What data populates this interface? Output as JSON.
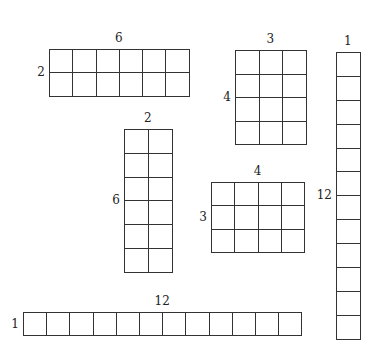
{
  "diagram": {
    "line_color": "#333333",
    "rectangles": [
      {
        "id": "r6x2",
        "cols": 6,
        "rows": 2,
        "width_label": "6",
        "height_label": "2",
        "x": 49,
        "y": 49,
        "cell": 23.3
      },
      {
        "id": "r3x4",
        "cols": 3,
        "rows": 4,
        "width_label": "3",
        "height_label": "4",
        "x": 235,
        "y": 50,
        "cell": 23.5
      },
      {
        "id": "r2x6",
        "cols": 2,
        "rows": 6,
        "width_label": "2",
        "height_label": "6",
        "x": 124,
        "y": 129,
        "cell": 23.8
      },
      {
        "id": "r4x3",
        "cols": 4,
        "rows": 3,
        "width_label": "4",
        "height_label": "3",
        "x": 211,
        "y": 182,
        "cell": 23.3
      },
      {
        "id": "r12x1",
        "cols": 12,
        "rows": 1,
        "width_label": "12",
        "height_label": "1",
        "x": 23,
        "y": 312,
        "cell": 23.2
      },
      {
        "id": "r1x12",
        "cols": 1,
        "rows": 12,
        "width_label": "1",
        "height_label": "12",
        "x": 336,
        "y": 52,
        "cell": 23.9
      }
    ]
  }
}
